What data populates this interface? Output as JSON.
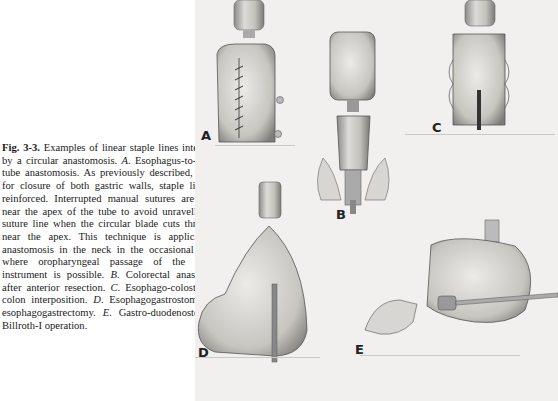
{
  "figure": {
    "label": "Fig. 3-3.",
    "caption_parts": [
      {
        "text": "Examples of linear staple lines intersected by a circular anastomosis. ",
        "style": "normal"
      },
      {
        "text": "A",
        "style": "italic"
      },
      {
        "text": ". Esophagus-to-gastric-tube anastomosis. As previously described, if used for closure of both gastric walls, staple lines are reinforced. Interrupted manual sutures are placed near the apex of the tube to avoid unravelling the suture line when the circular blade cuts through it near the apex. This technique is applicable to anastomosis in the neck in the occasional patient where oropharyngeal passage of the circular instrument is possible. ",
        "style": "normal"
      },
      {
        "text": "B",
        "style": "italic"
      },
      {
        "text": ". Colorectal anastomosis after anterior resection. ",
        "style": "normal"
      },
      {
        "text": "C",
        "style": "italic"
      },
      {
        "text": ". Esophago-colostomy in colon interposition. ",
        "style": "normal"
      },
      {
        "text": "D",
        "style": "italic"
      },
      {
        "text": ". Esophagogastrostomy after esophagogastrectomy. ",
        "style": "normal"
      },
      {
        "text": "E",
        "style": "italic"
      },
      {
        "text": ". Gastro-duodenostomy in Billroth-I operation.",
        "style": "normal"
      }
    ],
    "panels": [
      {
        "label": "A",
        "description": "Esophagus-to-gastric-tube anastomosis"
      },
      {
        "label": "B",
        "description": "Colorectal anastomosis after anterior resection"
      },
      {
        "label": "C",
        "description": "Esophago-colostomy in colon interposition"
      },
      {
        "label": "D",
        "description": "Esophagogastrostomy after esophagogastrectomy"
      },
      {
        "label": "E",
        "description": "Gastro-duodenostomy in Billroth-I operation"
      }
    ]
  }
}
